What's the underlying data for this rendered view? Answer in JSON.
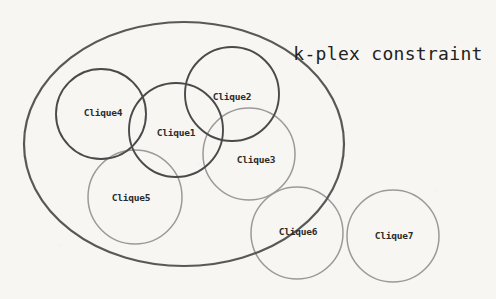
{
  "figure": {
    "title": "k-plex constraint",
    "title_position": {
      "x": 388,
      "y": 54
    },
    "background_color": "#f7f6f3",
    "dark_stroke_color": "#4a4a4a",
    "light_stroke_color": "#9a9a9a",
    "outer_region": {
      "name": "k-plex-region",
      "shape": "ellipse",
      "cx": 184,
      "cy": 144,
      "rx": 160,
      "ry": 122,
      "stroke": "#585858",
      "stroke_width": 2.2
    },
    "cliques": [
      {
        "label": "Clique1",
        "cx": 176,
        "cy": 130,
        "r": 47,
        "stroke": "#4a4a4a",
        "stroke_width": 1.9,
        "label_x": 176,
        "label_y": 133
      },
      {
        "label": "Clique2",
        "cx": 232,
        "cy": 94,
        "r": 47,
        "stroke": "#4a4a4a",
        "stroke_width": 1.9,
        "label_x": 232,
        "label_y": 97
      },
      {
        "label": "Clique3",
        "cx": 249,
        "cy": 154,
        "r": 46,
        "stroke": "#9a9a9a",
        "stroke_width": 1.5,
        "label_x": 256,
        "label_y": 160
      },
      {
        "label": "Clique4",
        "cx": 101,
        "cy": 114,
        "r": 45,
        "stroke": "#4a4a4a",
        "stroke_width": 1.9,
        "label_x": 103,
        "label_y": 113
      },
      {
        "label": "Clique5",
        "cx": 135,
        "cy": 197,
        "r": 47,
        "stroke": "#9a9a9a",
        "stroke_width": 1.5,
        "label_x": 131,
        "label_y": 198
      },
      {
        "label": "Clique6",
        "cx": 297,
        "cy": 233,
        "r": 46,
        "stroke": "#9a9a9a",
        "stroke_width": 1.5,
        "label_x": 298,
        "label_y": 232
      },
      {
        "label": "Clique7",
        "cx": 393,
        "cy": 236,
        "r": 46,
        "stroke": "#9a9a9a",
        "stroke_width": 1.5,
        "label_x": 394,
        "label_y": 236
      }
    ]
  }
}
